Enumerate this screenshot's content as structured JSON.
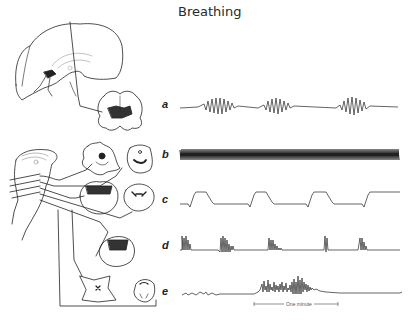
{
  "figure": {
    "title": "Breathing",
    "traces": [
      {
        "id": "a",
        "label": "a",
        "description": "waxing-waning (Cheyne-Stokes) pattern, forebrain lesion"
      },
      {
        "id": "b",
        "label": "b",
        "description": "sustained rapid hyperventilation, midbrain lesion"
      },
      {
        "id": "c",
        "label": "c",
        "description": "apneustic breathing, pontine lesion"
      },
      {
        "id": "d",
        "label": "d",
        "description": "cluster breathing, lower pontine lesion"
      },
      {
        "id": "e",
        "label": "e",
        "description": "ataxic breathing, medullary lesion"
      }
    ],
    "scale_bar": {
      "label": "One minute"
    }
  }
}
